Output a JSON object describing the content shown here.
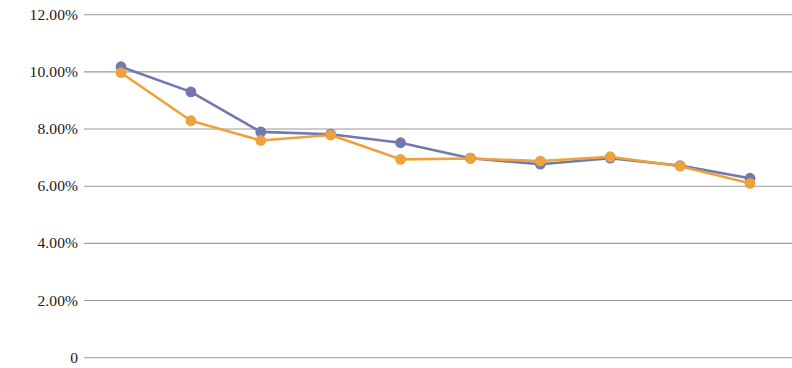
{
  "chart_data": {
    "type": "line",
    "title": "",
    "subtitle": "",
    "xlabel": "",
    "ylabel": "",
    "ylim": [
      0,
      12
    ],
    "ytick_values": [
      12,
      10,
      8,
      6,
      4,
      2,
      0
    ],
    "ytick_labels": [
      "12.00%",
      "10.00%",
      "8.00%",
      "6.00%",
      "4.00%",
      "2.00%",
      "0"
    ],
    "x": [
      1,
      2,
      3,
      4,
      5,
      6,
      7,
      8,
      9,
      10
    ],
    "xtick_labels": [],
    "grid": {
      "horizontal": true,
      "vertical": false,
      "color": "#9a9a9a"
    },
    "legend": {
      "visible": false,
      "position": "none"
    },
    "annotations": [],
    "series": [
      {
        "name": "Series 1",
        "color": "#7179ae",
        "marker": "circle",
        "values": [
          10.18,
          9.3,
          7.9,
          7.82,
          7.52,
          6.98,
          6.77,
          6.98,
          6.72,
          6.28
        ]
      },
      {
        "name": "Series 2",
        "color": "#eda23c",
        "marker": "circle",
        "values": [
          9.97,
          8.29,
          7.6,
          7.79,
          6.94,
          6.97,
          6.88,
          7.03,
          6.7,
          6.1
        ]
      }
    ]
  },
  "plot_geometry": {
    "left": 84,
    "right": 792,
    "top_value_y": 14.7,
    "bottom_value_y": 357.7,
    "first_point_x": 121,
    "last_point_x": 750,
    "marker_radius": 5.4,
    "line_width": 2.6
  }
}
